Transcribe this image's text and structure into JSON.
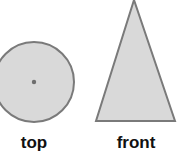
{
  "diagram": {
    "views": [
      {
        "label": "top",
        "shape": "circle-with-center-dot"
      },
      {
        "label": "front",
        "shape": "isosceles-triangle"
      }
    ],
    "colors": {
      "fill": "#d9d9d9",
      "stroke": "#7a7a7a",
      "dot": "#6e6e6e",
      "text": "#111111"
    }
  }
}
